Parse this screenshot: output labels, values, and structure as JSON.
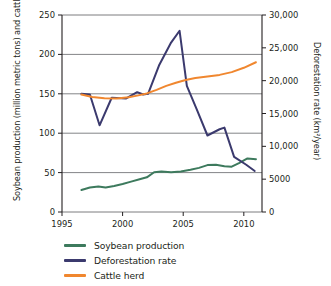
{
  "chart_data": {
    "type": "line",
    "title": "",
    "xlabel": "",
    "ylabel": "Soybean production (million metric tons) and cattle herd (million head)",
    "ylabel_right": "Deforestation rate (km²/year)",
    "xlim": [
      1995,
      2011.5
    ],
    "ylim": [
      0,
      250
    ],
    "ylim_right": [
      0,
      30000
    ],
    "xticks": [
      1995,
      2000,
      2005,
      2010
    ],
    "xtick_labels": [
      "1995",
      "2000",
      "2005",
      "2010"
    ],
    "yticks": [
      0,
      50,
      100,
      150,
      200,
      250
    ],
    "ytick_labels": [
      "0",
      "50",
      "100",
      "150",
      "200",
      "250"
    ],
    "yticks_right": [
      0,
      5000,
      10000,
      15000,
      20000,
      25000,
      30000
    ],
    "ytick_labels_right": [
      "0",
      "5000",
      "10,000",
      "15,000",
      "20,000",
      "25,000",
      "30,000"
    ],
    "grid": "horizontal",
    "legend_position": "below",
    "series": [
      {
        "name": "Soybean production",
        "axis": "left",
        "color": "#3d7a5d",
        "units": "million metric tons",
        "x": [
          1996.6,
          1997.3,
          1998.0,
          1998.6,
          1999.3,
          2000.0,
          2000.7,
          2001.4,
          2002.0,
          2002.6,
          2003.2,
          2004.0,
          2004.8,
          2005.6,
          2006.3,
          2007.0,
          2007.7,
          2008.4,
          2009.0,
          2009.6,
          2010.3,
          2011.0
        ],
        "y": [
          28,
          31,
          32.5,
          31,
          33,
          35.5,
          38.5,
          41.5,
          44,
          50.5,
          51.5,
          50.5,
          51.5,
          53.5,
          56,
          59.5,
          60,
          58,
          57.5,
          62,
          68,
          67
        ]
      },
      {
        "name": "Deforestation rate",
        "axis": "right",
        "color": "#3b3a6e",
        "units": "km2/year",
        "x": [
          1996.6,
          1997.3,
          1998.1,
          1999.1,
          2000.3,
          2001.2,
          2001.7,
          2002.1,
          2003.0,
          2004.0,
          2004.7,
          2005.3,
          2006.1,
          2007.0,
          2008.0,
          2008.4,
          2009.2,
          2010.2,
          2010.9
        ],
        "y_left_scale": [
          150,
          149,
          110,
          145,
          144,
          152,
          149,
          150,
          186,
          215,
          230,
          160,
          131,
          97,
          105,
          107,
          70,
          60,
          52
        ],
        "y": [
          18000,
          17900,
          13200,
          17400,
          17300,
          18250,
          17900,
          18000,
          22300,
          25800,
          27600,
          19200,
          15700,
          11650,
          12600,
          12850,
          8400,
          7200,
          6250
        ]
      },
      {
        "name": "Cattle herd",
        "axis": "left",
        "color": "#f0872f",
        "units": "million head",
        "x": [
          1996.6,
          1997.5,
          1998.5,
          1999.5,
          2000.5,
          2001.3,
          2002.0,
          2002.8,
          2003.6,
          2004.4,
          2005.2,
          2006.0,
          2007.0,
          2008.0,
          2009.0,
          2010.0,
          2011.0
        ],
        "y": [
          149,
          146,
          144.5,
          144,
          145.5,
          148,
          150.5,
          155,
          160,
          164,
          167.5,
          170,
          172,
          174,
          177.5,
          183,
          190
        ]
      }
    ]
  },
  "legend": {
    "items": [
      {
        "label": "Soybean production",
        "color": "#3d7a5d"
      },
      {
        "label": "Deforestation rate",
        "color": "#3b3a6e"
      },
      {
        "label": "Cattle herd",
        "color": "#f0872f"
      }
    ]
  }
}
